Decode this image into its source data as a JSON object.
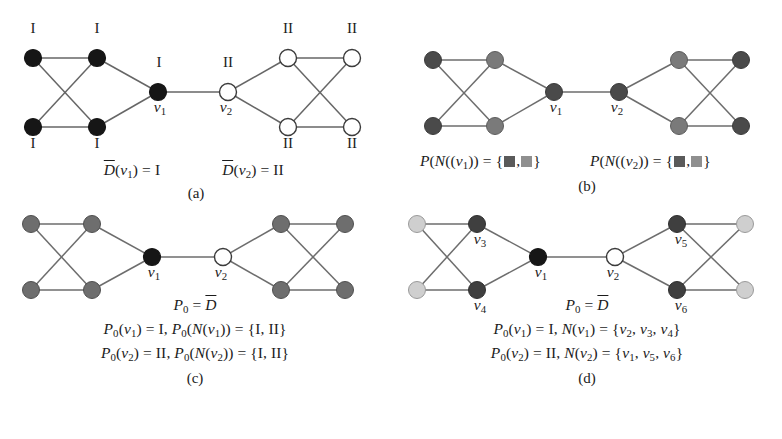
{
  "figure": {
    "title_cropped_top": "",
    "width": 782,
    "height": 439
  },
  "colors": {
    "black_node": "#161616",
    "white_node": "#ffffff",
    "mid_gray_node": "#6e6e6e",
    "dark_gray_node": "#4a4a4a",
    "light_gray_node": "#cfcfcf",
    "edge": "#666666",
    "node_stroke": "#3b3b3b",
    "text": "#1b1b1b",
    "swatch_dark": "#5a5a5a",
    "swatch_light": "#8f8f8f"
  },
  "panels": [
    {
      "id": "a",
      "caption": "(a)",
      "node_labels_left": [
        "I",
        "I",
        "I",
        "I"
      ],
      "hub_label_left": "I",
      "hub_name_left": "v1",
      "node_labels_right": [
        "II",
        "II",
        "II",
        "II"
      ],
      "hub_label_right": "II",
      "hub_name_right": "v2",
      "formula_left": "D(v1) = I",
      "formula_right": "D(v2) = II"
    },
    {
      "id": "b",
      "caption": "(b)",
      "hub_name_left": "v1",
      "hub_name_right": "v2",
      "formula_left": "P(N((v1)) = { ■ , ■ }",
      "formula_right": "P(N((v2)) = { ■ , ■ }"
    },
    {
      "id": "c",
      "caption": "(c)",
      "hub_name_left": "v1",
      "hub_name_right": "v2",
      "formula_head": "P0 = D",
      "formula_line1": "P0(v1) = I, P0(N(v1)) = {I, II}",
      "formula_line2": "P0(v2) = II, P0(N(v2)) = {I, II}"
    },
    {
      "id": "d",
      "caption": "(d)",
      "hub_name_left": "v1",
      "hub_name_right": "v2",
      "vertex_names": [
        "v3",
        "v4",
        "v5",
        "v6"
      ],
      "formula_head": "P0 = D",
      "formula_line1": "P0(v1) = I, N(v1) = {v2, v3, v4}",
      "formula_line2": "P0(v2) = II, N(v2) = {v1, v5, v6}"
    }
  ],
  "labels": {
    "roman_one": "I",
    "roman_two": "II",
    "v1": "v",
    "v1_sub": "1",
    "v2_sub": "2",
    "v3_sub": "3",
    "v4_sub": "4",
    "v5_sub": "5",
    "v6_sub": "6",
    "D": "D",
    "P": "P",
    "N": "N",
    "P0_sub": "0",
    "eq": "=",
    "comma": ",",
    "set_I_II": "{I, II}",
    "caption_a": "(a)",
    "caption_b": "(b)",
    "caption_c": "(c)",
    "caption_d": "(d)"
  }
}
